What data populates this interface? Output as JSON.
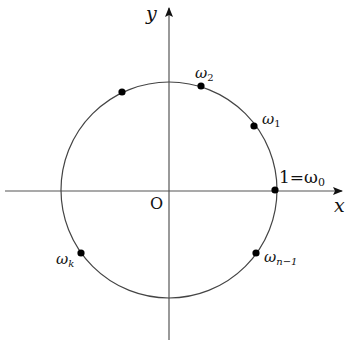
{
  "diagram": {
    "axes": {
      "x_label": "x",
      "y_label": "y",
      "origin_label": "O",
      "color": "#555555"
    },
    "circle": {
      "cx": 169,
      "cy": 190,
      "r": 108,
      "color": "#444444"
    },
    "points": [
      {
        "id": "omega0",
        "label_main": "1=ω",
        "label_sub": "0",
        "x": 275,
        "y": 190
      },
      {
        "id": "omega1",
        "label_main": "ω",
        "label_sub": "1",
        "x": 254,
        "y": 126
      },
      {
        "id": "omega2",
        "label_main": "ω",
        "label_sub": "2",
        "x": 201,
        "y": 86
      },
      {
        "id": "unlabeled",
        "label_main": "",
        "label_sub": "",
        "x": 122,
        "y": 92
      },
      {
        "id": "omegak",
        "label_main": "ω",
        "label_sub": "k",
        "x": 81,
        "y": 253
      },
      {
        "id": "omegan1",
        "label_main": "ω",
        "label_sub": "n−1",
        "x": 256,
        "y": 253
      }
    ],
    "dot_color": "#000000"
  }
}
